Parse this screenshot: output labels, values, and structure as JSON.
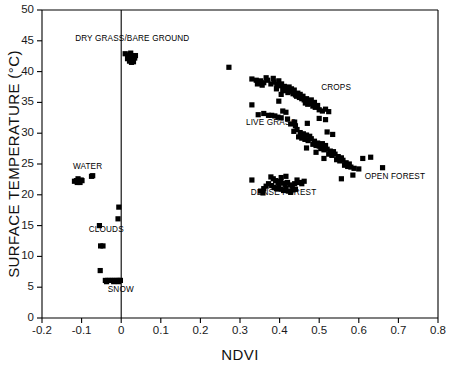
{
  "chart_data": {
    "type": "scatter",
    "title": "",
    "xlabel": "NDVI",
    "ylabel": "SURFACE TEMPERATURE (°C)",
    "xlim": [
      -0.2,
      0.8
    ],
    "ylim": [
      0,
      50
    ],
    "xticks": [
      -0.2,
      -0.1,
      0,
      0.1,
      0.2,
      0.3,
      0.4,
      0.5,
      0.6,
      0.7,
      0.8
    ],
    "xticklabels": [
      "-0.2",
      "-0.1",
      "0",
      "0.1",
      "0.2",
      "0.3",
      "0.4",
      "0.5",
      "0.6",
      "0.7",
      "0.8"
    ],
    "yticks": [
      0,
      5,
      10,
      15,
      20,
      25,
      30,
      35,
      40,
      45,
      50
    ],
    "yticklabels": [
      "0",
      "5",
      "10",
      "15",
      "20",
      "25",
      "30",
      "35",
      "40",
      "45",
      "50"
    ],
    "grid": false,
    "legend": "none",
    "marker": "square",
    "marker_color": "#000000",
    "reference_lines": [
      {
        "orientation": "vertical",
        "x": 0.0
      }
    ],
    "annotations": [
      {
        "label": "DRY GRASS/BARE GROUND",
        "x": 0.028,
        "y": 45.0,
        "anchor": "middle"
      },
      {
        "label": "WATER",
        "x": -0.122,
        "y": 24.2,
        "anchor": "start"
      },
      {
        "label": "CLOUDS",
        "x": -0.082,
        "y": 13.9,
        "anchor": "start"
      },
      {
        "label": "SNOW",
        "x": -0.034,
        "y": 4.2,
        "anchor": "start"
      },
      {
        "label": "CROPS",
        "x": 0.505,
        "y": 37.0,
        "anchor": "start"
      },
      {
        "label": "LIVE GRASS",
        "x": 0.315,
        "y": 31.3,
        "anchor": "start"
      },
      {
        "label": "DENSE FOREST",
        "x": 0.41,
        "y": 20.0,
        "anchor": "middle"
      },
      {
        "label": "OPEN FOREST",
        "x": 0.615,
        "y": 22.6,
        "anchor": "start"
      }
    ],
    "series": [
      {
        "name": "WATER",
        "points": [
          [
            -0.118,
            22.2
          ],
          [
            -0.113,
            22.3
          ],
          [
            -0.109,
            22.6
          ],
          [
            -0.106,
            22.2
          ],
          [
            -0.101,
            22.4
          ],
          [
            -0.104,
            22.0
          ],
          [
            -0.111,
            22.0
          ],
          [
            -0.099,
            22.3
          ],
          [
            -0.075,
            23.0
          ],
          [
            -0.072,
            23.1
          ]
        ]
      },
      {
        "name": "CLOUDS",
        "points": [
          [
            -0.006,
            18.0
          ],
          [
            -0.008,
            16.1
          ],
          [
            -0.055,
            15.0
          ],
          [
            -0.046,
            11.7
          ],
          [
            -0.052,
            11.7
          ],
          [
            -0.053,
            7.7
          ]
        ]
      },
      {
        "name": "SNOW",
        "points": [
          [
            -0.04,
            6.1
          ],
          [
            -0.034,
            6.1
          ],
          [
            -0.028,
            6.1
          ],
          [
            -0.022,
            6.1
          ],
          [
            -0.016,
            6.1
          ],
          [
            -0.01,
            6.1
          ],
          [
            -0.005,
            6.1
          ],
          [
            -0.002,
            6.1
          ],
          [
            -0.037,
            5.9
          ],
          [
            -0.019,
            5.9
          ],
          [
            -0.007,
            5.9
          ]
        ]
      },
      {
        "name": "DRY GRASS/BARE GROUND",
        "points": [
          [
            0.01,
            42.9
          ],
          [
            0.017,
            42.6
          ],
          [
            0.022,
            42.8
          ],
          [
            0.026,
            42.4
          ],
          [
            0.03,
            42.3
          ],
          [
            0.034,
            42.2
          ],
          [
            0.021,
            41.7
          ],
          [
            0.026,
            41.5
          ],
          [
            0.031,
            41.6
          ],
          [
            0.016,
            42.1
          ],
          [
            0.036,
            42.6
          ],
          [
            0.024,
            43.0
          ]
        ]
      },
      {
        "name": "CROPS",
        "points": [
          [
            0.272,
            40.7
          ],
          [
            0.33,
            38.8
          ],
          [
            0.341,
            38.6
          ],
          [
            0.352,
            38.5
          ],
          [
            0.36,
            38.2
          ],
          [
            0.37,
            38.6
          ],
          [
            0.378,
            38.0
          ],
          [
            0.386,
            38.3
          ],
          [
            0.393,
            37.9
          ],
          [
            0.4,
            37.7
          ],
          [
            0.366,
            39.0
          ],
          [
            0.384,
            38.9
          ],
          [
            0.398,
            38.5
          ],
          [
            0.405,
            38.0
          ],
          [
            0.412,
            37.6
          ],
          [
            0.418,
            37.3
          ],
          [
            0.424,
            37.5
          ],
          [
            0.408,
            37.0
          ],
          [
            0.415,
            36.9
          ],
          [
            0.421,
            36.6
          ],
          [
            0.428,
            36.8
          ],
          [
            0.434,
            36.4
          ],
          [
            0.44,
            36.2
          ],
          [
            0.446,
            36.5
          ],
          [
            0.43,
            37.2
          ],
          [
            0.437,
            37.0
          ],
          [
            0.443,
            36.0
          ],
          [
            0.45,
            35.8
          ],
          [
            0.456,
            35.6
          ],
          [
            0.462,
            35.4
          ],
          [
            0.468,
            35.6
          ],
          [
            0.474,
            35.1
          ],
          [
            0.452,
            36.3
          ],
          [
            0.459,
            36.0
          ],
          [
            0.465,
            34.9
          ],
          [
            0.471,
            34.7
          ],
          [
            0.478,
            34.8
          ],
          [
            0.484,
            34.4
          ],
          [
            0.49,
            34.2
          ],
          [
            0.404,
            36.3
          ],
          [
            0.392,
            37.2
          ],
          [
            0.356,
            37.8
          ],
          [
            0.344,
            38.0
          ],
          [
            0.398,
            35.2
          ],
          [
            0.5,
            33.8
          ],
          [
            0.508,
            33.6
          ],
          [
            0.516,
            33.9
          ],
          [
            0.524,
            33.5
          ],
          [
            0.496,
            34.5
          ],
          [
            0.488,
            35.0
          ],
          [
            0.48,
            35.4
          ]
        ]
      },
      {
        "name": "LIVE GRASS",
        "points": [
          [
            0.36,
            33.2
          ],
          [
            0.372,
            32.9
          ],
          [
            0.38,
            32.9
          ],
          [
            0.388,
            32.8
          ],
          [
            0.396,
            32.6
          ],
          [
            0.404,
            32.5
          ],
          [
            0.346,
            33.0
          ],
          [
            0.42,
            32.3
          ],
          [
            0.416,
            33.4
          ],
          [
            0.408,
            33.6
          ],
          [
            0.33,
            34.6
          ],
          [
            0.438,
            31.8
          ],
          [
            0.5,
            32.4
          ],
          [
            0.516,
            32.2
          ],
          [
            0.47,
            31.6
          ]
        ]
      },
      {
        "name": "OPEN FOREST",
        "points": [
          [
            0.436,
            30.3
          ],
          [
            0.444,
            30.6
          ],
          [
            0.452,
            30.1
          ],
          [
            0.46,
            29.9
          ],
          [
            0.468,
            29.7
          ],
          [
            0.476,
            29.5
          ],
          [
            0.448,
            29.4
          ],
          [
            0.456,
            29.2
          ],
          [
            0.464,
            29.0
          ],
          [
            0.472,
            28.8
          ],
          [
            0.48,
            29.1
          ],
          [
            0.488,
            28.7
          ],
          [
            0.496,
            28.4
          ],
          [
            0.484,
            28.2
          ],
          [
            0.492,
            28.0
          ],
          [
            0.5,
            27.9
          ],
          [
            0.508,
            28.3
          ],
          [
            0.516,
            28.0
          ],
          [
            0.504,
            27.5
          ],
          [
            0.512,
            27.3
          ],
          [
            0.52,
            27.4
          ],
          [
            0.528,
            27.1
          ],
          [
            0.536,
            27.0
          ],
          [
            0.524,
            26.6
          ],
          [
            0.532,
            26.4
          ],
          [
            0.54,
            26.6
          ],
          [
            0.548,
            26.2
          ],
          [
            0.556,
            26.0
          ],
          [
            0.544,
            25.7
          ],
          [
            0.552,
            25.5
          ],
          [
            0.56,
            25.6
          ],
          [
            0.568,
            25.2
          ],
          [
            0.576,
            25.0
          ],
          [
            0.564,
            24.8
          ],
          [
            0.572,
            24.6
          ],
          [
            0.58,
            24.5
          ],
          [
            0.588,
            24.3
          ],
          [
            0.6,
            24.2
          ],
          [
            0.61,
            25.9
          ],
          [
            0.63,
            26.1
          ],
          [
            0.585,
            23.2
          ],
          [
            0.556,
            22.6
          ],
          [
            0.66,
            24.4
          ],
          [
            0.534,
            29.8
          ],
          [
            0.52,
            30.2
          ],
          [
            0.44,
            31.2
          ],
          [
            0.428,
            31.5
          ],
          [
            0.492,
            26.9
          ],
          [
            0.512,
            25.9
          ],
          [
            0.468,
            27.6
          ]
        ]
      },
      {
        "name": "DENSE FOREST",
        "points": [
          [
            0.33,
            22.4
          ],
          [
            0.378,
            22.9
          ],
          [
            0.384,
            22.6
          ],
          [
            0.39,
            22.3
          ],
          [
            0.396,
            22.0
          ],
          [
            0.402,
            22.2
          ],
          [
            0.408,
            21.9
          ],
          [
            0.414,
            21.7
          ],
          [
            0.42,
            22.0
          ],
          [
            0.426,
            21.6
          ],
          [
            0.432,
            21.4
          ],
          [
            0.438,
            21.8
          ],
          [
            0.38,
            21.5
          ],
          [
            0.386,
            21.2
          ],
          [
            0.392,
            21.0
          ],
          [
            0.398,
            21.3
          ],
          [
            0.404,
            20.9
          ],
          [
            0.41,
            20.7
          ],
          [
            0.416,
            21.0
          ],
          [
            0.422,
            20.6
          ],
          [
            0.428,
            20.4
          ],
          [
            0.434,
            20.8
          ],
          [
            0.372,
            21.8
          ],
          [
            0.366,
            21.4
          ],
          [
            0.36,
            21.0
          ],
          [
            0.444,
            22.4
          ],
          [
            0.45,
            22.0
          ],
          [
            0.456,
            21.8
          ],
          [
            0.462,
            22.2
          ],
          [
            0.352,
            20.6
          ],
          [
            0.358,
            20.3
          ],
          [
            0.404,
            22.8
          ],
          [
            0.416,
            23.0
          ],
          [
            0.44,
            20.9
          ]
        ]
      }
    ]
  },
  "figure": {
    "degree_symbol": "°",
    "background_color": "#ffffff",
    "axis_color": "#000000",
    "point_color": "#000000"
  }
}
